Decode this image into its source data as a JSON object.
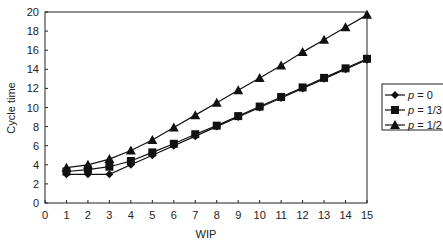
{
  "chart_data": {
    "type": "line",
    "title": "",
    "xlabel": "WIP",
    "ylabel": "Cycle time",
    "xlim": [
      0,
      15
    ],
    "ylim": [
      0,
      20
    ],
    "xticks": [
      0,
      1,
      2,
      3,
      4,
      5,
      6,
      7,
      8,
      9,
      10,
      11,
      12,
      13,
      14,
      15
    ],
    "yticks": [
      0,
      2,
      4,
      6,
      8,
      10,
      12,
      14,
      16,
      18,
      20
    ],
    "grid": false,
    "legend_position": "right",
    "x": [
      1,
      2,
      3,
      4,
      5,
      6,
      7,
      8,
      9,
      10,
      11,
      12,
      13,
      14,
      15
    ],
    "series": [
      {
        "name": "p = 0",
        "var": "p",
        "eq": " = 0",
        "marker": "diamond",
        "values": [
          3.0,
          3.0,
          3.0,
          4.0,
          5.0,
          6.0,
          7.0,
          8.0,
          9.0,
          10.0,
          11.0,
          12.0,
          13.0,
          14.0,
          15.0
        ]
      },
      {
        "name": "p = 1/3",
        "var": "p",
        "eq": " = 1/3",
        "marker": "square",
        "values": [
          3.3,
          3.5,
          3.8,
          4.4,
          5.3,
          6.2,
          7.2,
          8.1,
          9.1,
          10.1,
          11.1,
          12.1,
          13.1,
          14.1,
          15.1
        ]
      },
      {
        "name": "p = 1/2",
        "var": "p",
        "eq": " = 1/2",
        "marker": "triangle",
        "values": [
          3.7,
          4.0,
          4.6,
          5.5,
          6.6,
          7.9,
          9.2,
          10.5,
          11.8,
          13.1,
          14.4,
          15.8,
          17.1,
          18.4,
          19.7
        ]
      }
    ],
    "colors": {
      "line": "#111111",
      "axis": "#222222"
    }
  }
}
